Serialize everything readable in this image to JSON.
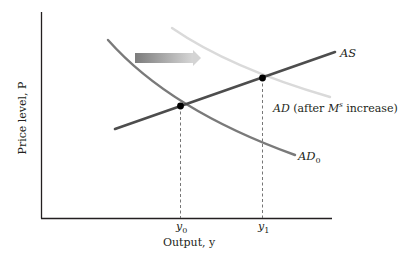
{
  "diagram": {
    "type": "AS-AD model",
    "axes": {
      "y_label": "Price level, P",
      "x_label": "Output, y",
      "x_ticks": [
        {
          "main": "y",
          "sub": "0"
        },
        {
          "main": "y",
          "sub": "1"
        }
      ]
    },
    "curves": {
      "as": {
        "label": "AS",
        "color": "#4d4d4d"
      },
      "ad0": {
        "label_main": "AD",
        "label_sub": "0",
        "color": "#7a7a7a"
      },
      "ad1": {
        "label_main": "AD",
        "label_rest_1": " (after ",
        "label_m": "M",
        "label_sup": "s",
        "label_rest_2": " increase)",
        "color": "#dcdcdc"
      }
    },
    "equilibria": [
      {
        "name": "initial",
        "x_label": "y0"
      },
      {
        "name": "new",
        "x_label": "y1"
      }
    ],
    "shift_arrow": {
      "direction": "right",
      "meaning": "AD shifts right after money supply increase"
    }
  }
}
